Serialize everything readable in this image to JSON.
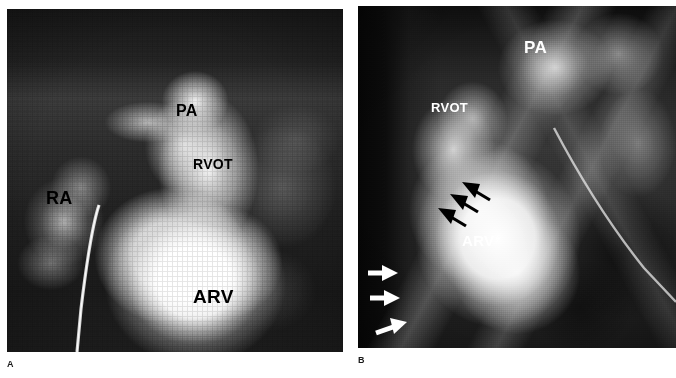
{
  "figure": {
    "type": "two-panel-angiogram",
    "modality": "cineangiocardiogram",
    "background_color": "#ffffff"
  },
  "panels": [
    {
      "id": "A",
      "caption": "A",
      "label_color_dark": "#000000",
      "annotations": [
        {
          "name": "pa",
          "text": "PA",
          "style": "dark",
          "x": 169,
          "y": 94,
          "size": 16
        },
        {
          "name": "rvot",
          "text": "RVOT",
          "style": "dark",
          "x": 186,
          "y": 148,
          "size": 14
        },
        {
          "name": "ra",
          "text": "RA",
          "style": "dark",
          "x": 39,
          "y": 180,
          "size": 18
        },
        {
          "name": "arv",
          "text": "ARV",
          "style": "dark",
          "x": 186,
          "y": 278,
          "size": 19
        }
      ],
      "arrows": []
    },
    {
      "id": "B",
      "caption": "B",
      "label_color_light": "#ffffff",
      "annotations": [
        {
          "name": "pa",
          "text": "PA",
          "style": "light",
          "x": 166,
          "y": 33,
          "size": 17
        },
        {
          "name": "rvot",
          "text": "RVOT",
          "style": "light",
          "x": 73,
          "y": 95,
          "size": 13
        },
        {
          "name": "arv",
          "text": "ARV",
          "style": "light",
          "x": 104,
          "y": 227,
          "size": 15
        }
      ],
      "arrows": [
        {
          "name": "black-arrow-1",
          "color": "#000000",
          "tip_x": 104,
          "tip_y": 176,
          "tail_x": 130,
          "tail_y": 192
        },
        {
          "name": "black-arrow-2",
          "color": "#000000",
          "tip_x": 92,
          "tip_y": 188,
          "tail_x": 118,
          "tail_y": 204
        },
        {
          "name": "black-arrow-3",
          "color": "#000000",
          "tip_x": 80,
          "tip_y": 202,
          "tail_x": 106,
          "tail_y": 218
        },
        {
          "name": "white-arrow-1",
          "color": "#ffffff",
          "tip_x": 36,
          "tip_y": 267,
          "tail_x": 10,
          "tail_y": 267
        },
        {
          "name": "white-arrow-2",
          "color": "#ffffff",
          "tip_x": 38,
          "tip_y": 292,
          "tail_x": 12,
          "tail_y": 292
        },
        {
          "name": "white-arrow-3",
          "color": "#ffffff",
          "tip_x": 46,
          "tip_y": 317,
          "tail_x": 18,
          "tail_y": 326
        }
      ]
    }
  ],
  "captions": {
    "panel_a": "A",
    "panel_b": "B"
  },
  "legend_terms": {
    "PA": "PA",
    "RVOT": "RVOT",
    "RA": "RA",
    "ARV": "ARV"
  }
}
